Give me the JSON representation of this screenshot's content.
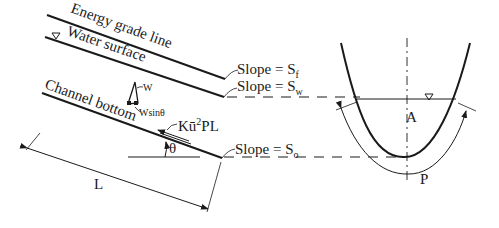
{
  "diagram": {
    "profile": {
      "energy_grade_line": "Energy grade line",
      "water_surface": "Water surface",
      "channel_bottom": "Channel bottom",
      "weight": "W",
      "weight_component": "Wsinθ",
      "shear_force": "Kū²PL",
      "angle": "θ",
      "length": "L"
    },
    "slopes": {
      "friction": {
        "prefix": "Slope = S",
        "sub": "f"
      },
      "water": {
        "prefix": "Slope = S",
        "sub": "w"
      },
      "bottom": {
        "prefix": "Slope = S",
        "sub": "o"
      }
    },
    "cross_section": {
      "area": "A",
      "perimeter": "P",
      "water_symbol": "▽"
    },
    "colors": {
      "ink": "#1a1a1a",
      "background": "#ffffff"
    }
  }
}
